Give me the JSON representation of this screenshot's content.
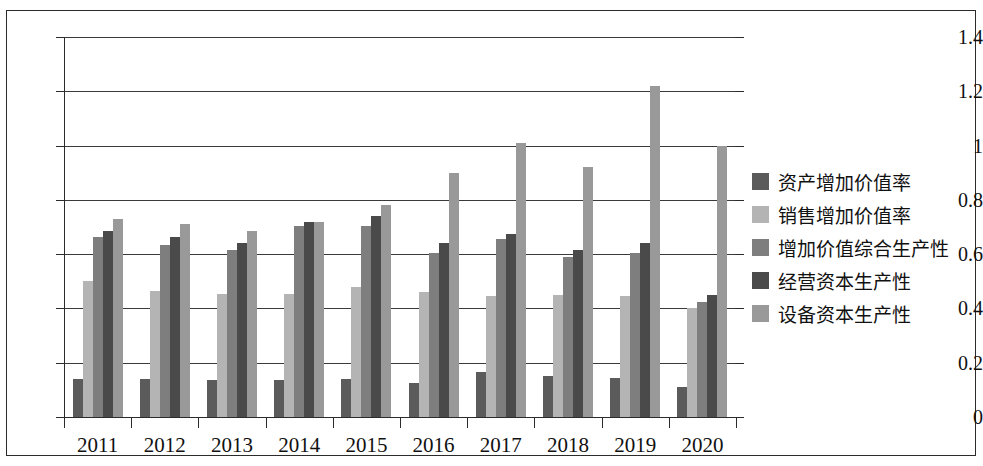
{
  "chart_data": {
    "type": "bar",
    "title": "",
    "subtitle": "",
    "xlabel": "",
    "ylabel": "",
    "ylim": [
      0,
      1.4
    ],
    "ytick_labels": [
      "1.4",
      "1.2",
      "1",
      "0.8",
      "0.6",
      "0.4",
      "0.2",
      "0"
    ],
    "ytick_values": [
      1.4,
      1.2,
      1.0,
      0.8,
      0.6,
      0.4,
      0.2,
      0
    ],
    "grid": true,
    "grid_axis": "y",
    "legend_position": "right",
    "categories": [
      "2011",
      "2012",
      "2013",
      "2014",
      "2015",
      "2016",
      "2017",
      "2018",
      "2019",
      "2020"
    ],
    "series": [
      {
        "name": "资产增加价值率",
        "color": "#5b5b5b",
        "values": [
          0.14,
          0.14,
          0.135,
          0.135,
          0.14,
          0.125,
          0.165,
          0.15,
          0.145,
          0.11
        ]
      },
      {
        "name": "销售增加价值率",
        "color": "#b4b4b4",
        "values": [
          0.5,
          0.465,
          0.455,
          0.455,
          0.48,
          0.46,
          0.445,
          0.45,
          0.445,
          0.4
        ]
      },
      {
        "name": "增加价值综合生产性",
        "color": "#7e7e7e",
        "values": [
          0.665,
          0.635,
          0.615,
          0.705,
          0.705,
          0.605,
          0.655,
          0.59,
          0.605,
          0.425
        ]
      },
      {
        "name": "经营资本生产性",
        "color": "#4a4a4a",
        "values": [
          0.685,
          0.665,
          0.64,
          0.72,
          0.74,
          0.64,
          0.675,
          0.615,
          0.64,
          0.45
        ]
      },
      {
        "name": "设备资本生产性",
        "color": "#999999",
        "values": [
          0.73,
          0.71,
          0.685,
          0.72,
          0.78,
          0.9,
          1.01,
          0.92,
          1.22,
          1.0
        ]
      }
    ]
  }
}
